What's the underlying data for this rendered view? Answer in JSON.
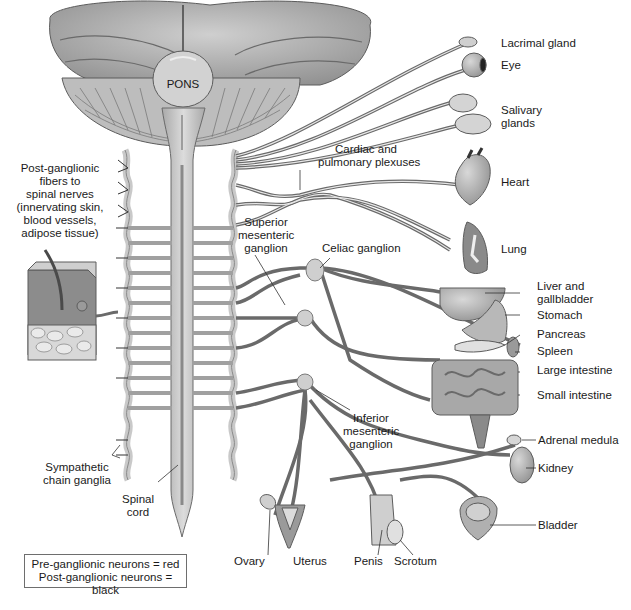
{
  "diagram": {
    "colors": {
      "background": "#ffffff",
      "tissue_light": "#d6d6d6",
      "tissue_mid": "#b4b4b4",
      "tissue_dark": "#7a7a7a",
      "nerve_outline": "#6a6a6a",
      "text": "#1a1a1a"
    },
    "structures": {
      "pons": "PONS"
    },
    "labels": {
      "post_ganglionic": [
        "Post-ganglionic",
        "fibers to",
        "spinal nerves",
        "(innervating skin,",
        "blood vessels,",
        "adipose tissue)"
      ],
      "sympathetic_chain": [
        "Sympathetic",
        "chain ganglia"
      ],
      "spinal_cord": [
        "Spinal",
        "cord"
      ],
      "cardiac_plexus": [
        "Cardiac and",
        "pulmonary plexuses"
      ],
      "superior_mesenteric": [
        "Superior",
        "mesenteric",
        "ganglion"
      ],
      "celiac": "Celiac ganglion",
      "inferior_mesenteric": [
        "Inferior",
        "mesenteric",
        "ganglion"
      ]
    },
    "organs": [
      {
        "id": "lacrimal",
        "label": "Lacrimal gland"
      },
      {
        "id": "eye",
        "label": "Eye"
      },
      {
        "id": "salivary",
        "label": [
          "Salivary",
          "glands"
        ]
      },
      {
        "id": "heart",
        "label": "Heart"
      },
      {
        "id": "lung",
        "label": "Lung"
      },
      {
        "id": "liver",
        "label": [
          "Liver and",
          "gallbladder"
        ]
      },
      {
        "id": "stomach",
        "label": "Stomach"
      },
      {
        "id": "pancreas",
        "label": "Pancreas"
      },
      {
        "id": "spleen",
        "label": "Spleen"
      },
      {
        "id": "large_intestine",
        "label": "Large intestine"
      },
      {
        "id": "small_intestine",
        "label": "Small intestine"
      },
      {
        "id": "adrenal",
        "label": "Adrenal medula"
      },
      {
        "id": "kidney",
        "label": "Kidney"
      },
      {
        "id": "bladder",
        "label": "Bladder"
      },
      {
        "id": "ovary",
        "label": "Ovary"
      },
      {
        "id": "uterus",
        "label": "Uterus"
      },
      {
        "id": "penis",
        "label": "Penis"
      },
      {
        "id": "scrotum",
        "label": "Scrotum"
      }
    ],
    "legend": {
      "line1": "Pre-ganglionic neurons = red",
      "line2": "Post-ganglionic neurons = black"
    }
  }
}
